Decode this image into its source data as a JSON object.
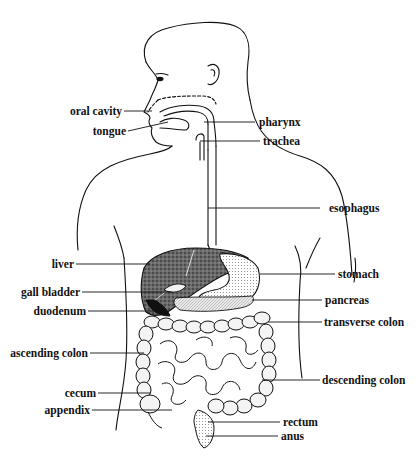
{
  "diagram": {
    "stroke_color": "#111111",
    "background": "#ffffff",
    "labels": [
      {
        "id": "oral-cavity",
        "text": "oral cavity",
        "side": "left"
      },
      {
        "id": "tongue",
        "text": "tongue",
        "side": "left"
      },
      {
        "id": "pharynx",
        "text": "pharynx",
        "side": "right"
      },
      {
        "id": "trachea",
        "text": "trachea",
        "side": "right"
      },
      {
        "id": "esophagus",
        "text": "esophagus",
        "side": "right"
      },
      {
        "id": "liver",
        "text": "liver",
        "side": "left"
      },
      {
        "id": "stomach",
        "text": "stomach",
        "side": "right"
      },
      {
        "id": "gall-bladder",
        "text": "gall bladder",
        "side": "left"
      },
      {
        "id": "pancreas",
        "text": "pancreas",
        "side": "right"
      },
      {
        "id": "duodenum",
        "text": "duodenum",
        "side": "left"
      },
      {
        "id": "transverse-colon",
        "text": "transverse colon",
        "side": "right"
      },
      {
        "id": "ascending-colon",
        "text": "ascending colon",
        "side": "left"
      },
      {
        "id": "descending-colon",
        "text": "descending colon",
        "side": "right"
      },
      {
        "id": "cecum",
        "text": "cecum",
        "side": "left"
      },
      {
        "id": "appendix",
        "text": "appendix",
        "side": "left"
      },
      {
        "id": "rectum",
        "text": "rectum",
        "side": "right"
      },
      {
        "id": "anus",
        "text": "anus",
        "side": "right"
      }
    ]
  }
}
